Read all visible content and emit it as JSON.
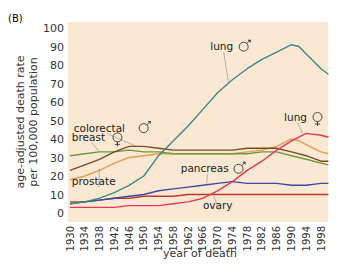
{
  "panel_label": "(B)",
  "chart_data": {
    "type": "line",
    "title": "",
    "xlabel": "year of death",
    "ylabel": "age-adjusted death rate per 100,000 population",
    "ylabel_lines": [
      "age-adjusted death rate",
      "per 100,000 population"
    ],
    "xlim": [
      1930,
      2000
    ],
    "ylim": [
      0,
      100
    ],
    "grid": false,
    "background": "#fbe8d3",
    "yticks": [
      0,
      10,
      20,
      30,
      40,
      50,
      60,
      70,
      80,
      90,
      100
    ],
    "xticks": [
      1930,
      1934,
      1938,
      1942,
      1946,
      1950,
      1954,
      1958,
      1962,
      1966,
      1970,
      1974,
      1978,
      1982,
      1986,
      1990,
      1994,
      1998
    ],
    "series": [
      {
        "name": "lung ♂",
        "label": "lung",
        "sex": "male",
        "color": "#3a8a82",
        "x": [
          1930,
          1934,
          1938,
          1942,
          1946,
          1950,
          1954,
          1958,
          1962,
          1966,
          1970,
          1974,
          1978,
          1982,
          1986,
          1988,
          1990,
          1992,
          1994,
          1996,
          1998,
          2000
        ],
        "values": [
          5,
          6,
          8,
          11,
          15,
          20,
          31,
          39,
          47,
          56,
          65,
          72,
          78,
          83,
          87,
          89,
          91,
          90,
          86,
          82,
          78,
          75
        ]
      },
      {
        "name": "lung ♀",
        "label": "lung",
        "sex": "female",
        "color": "#e8365a",
        "x": [
          1930,
          1934,
          1938,
          1942,
          1946,
          1950,
          1954,
          1958,
          1962,
          1966,
          1970,
          1974,
          1978,
          1982,
          1986,
          1990,
          1994,
          1998,
          2000
        ],
        "values": [
          3,
          3,
          3,
          3,
          4,
          4,
          4,
          5,
          6,
          8,
          12,
          17,
          23,
          28,
          34,
          39,
          43,
          42,
          41
        ]
      },
      {
        "name": "colorectal ♂",
        "label": "colorectal",
        "sex": "male",
        "color": "#7a4a2a",
        "x": [
          1930,
          1934,
          1938,
          1942,
          1946,
          1950,
          1954,
          1958,
          1962,
          1966,
          1970,
          1974,
          1978,
          1982,
          1986,
          1990,
          1994,
          1998,
          2000
        ],
        "values": [
          23,
          26,
          29,
          33,
          36,
          36,
          35,
          34,
          34,
          34,
          34,
          34,
          35,
          35,
          35,
          33,
          31,
          28,
          28
        ]
      },
      {
        "name": "breast ♀",
        "label": "breast",
        "sex": "female",
        "color": "#6a9a3a",
        "x": [
          1930,
          1934,
          1938,
          1942,
          1946,
          1950,
          1954,
          1958,
          1962,
          1966,
          1970,
          1974,
          1978,
          1982,
          1986,
          1990,
          1994,
          1998,
          2000
        ],
        "values": [
          31,
          32,
          33,
          33,
          34,
          33,
          33,
          32,
          32,
          32,
          32,
          32,
          32,
          33,
          33,
          31,
          29,
          27,
          26
        ]
      },
      {
        "name": "prostate",
        "label": "prostate",
        "sex": "male",
        "color": "#e0a050",
        "x": [
          1930,
          1934,
          1938,
          1942,
          1946,
          1950,
          1954,
          1958,
          1962,
          1966,
          1970,
          1974,
          1978,
          1982,
          1986,
          1988,
          1990,
          1992,
          1994,
          1996,
          1998,
          2000
        ],
        "values": [
          18,
          20,
          23,
          27,
          30,
          31,
          32,
          32,
          32,
          32,
          32,
          32,
          33,
          34,
          36,
          38,
          40,
          39,
          37,
          35,
          33,
          32
        ]
      },
      {
        "name": "pancreas ♂",
        "label": "pancreas",
        "sex": "male",
        "color": "#3a4aa0",
        "x": [
          1930,
          1934,
          1938,
          1942,
          1946,
          1950,
          1954,
          1958,
          1962,
          1966,
          1970,
          1974,
          1978,
          1982,
          1986,
          1990,
          1994,
          1998,
          2000
        ],
        "values": [
          5,
          6,
          7,
          8,
          9,
          10,
          12,
          13,
          14,
          15,
          16,
          17,
          16,
          16,
          16,
          15,
          15,
          16,
          16
        ]
      },
      {
        "name": "ovary",
        "label": "ovary",
        "sex": "female",
        "color": "#c0392b",
        "x": [
          1930,
          1934,
          1938,
          1942,
          1946,
          1950,
          1954,
          1958,
          1962,
          1966,
          1970,
          1974,
          1978,
          1982,
          1986,
          1990,
          1994,
          1998,
          2000
        ],
        "values": [
          6,
          6,
          7,
          8,
          8,
          9,
          9,
          9,
          10,
          10,
          10,
          10,
          10,
          10,
          10,
          10,
          10,
          10,
          10
        ]
      }
    ],
    "annotations": [
      {
        "text": "lung",
        "symbol": "male",
        "series": "lung ♂",
        "x": 1968,
        "y": 88,
        "leader_to": [
          1973,
          70
        ]
      },
      {
        "text": "lung",
        "symbol": "female",
        "series": "lung ♀",
        "x": 1988,
        "y": 50,
        "leader_to": [
          1993,
          43
        ]
      },
      {
        "text": "colorectal",
        "symbol": "male",
        "series": "colorectal ♂",
        "x": 1931,
        "y": 44,
        "leader_to": [
          1948,
          36
        ]
      },
      {
        "text": "breast",
        "symbol": "female",
        "series": "breast ♀",
        "x": 1930.5,
        "y": 39,
        "leader_to": [
          1938,
          33
        ]
      },
      {
        "text": "prostate",
        "symbol": "",
        "series": "prostate",
        "x": 1930.5,
        "y": 15,
        "leader_to": [
          1938,
          24
        ]
      },
      {
        "text": "pancreas",
        "symbol": "male",
        "series": "pancreas ♂",
        "x": 1960,
        "y": 22,
        "leader_to": [
          1967,
          16
        ]
      },
      {
        "text": "ovary",
        "symbol": "",
        "series": "ovary",
        "x": 1966,
        "y": 2,
        "leader_to": [
          1969,
          9
        ]
      }
    ]
  }
}
